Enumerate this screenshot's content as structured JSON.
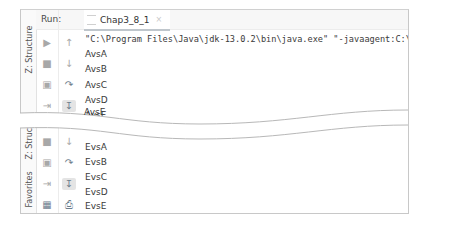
{
  "run_panel": {
    "run_label": "Run:",
    "tab": {
      "label": "Chap3_8_1",
      "close": "×"
    },
    "side_labels": {
      "structure": "Z: Structure",
      "favorites": "Favorites"
    }
  },
  "top_console": {
    "command_line": "\"C:\\Program Files\\Java\\jdk-13.0.2\\bin\\java.exe\" \"-javaagent:C:\\Progr",
    "lines": [
      "AvsA",
      "AvsB",
      "AvsC",
      "AvsD",
      "AvsE"
    ]
  },
  "bottom_console": {
    "lines": [
      "EvsA",
      "EvsB",
      "EvsC",
      "EvsD",
      "EvsE"
    ]
  },
  "icons": {
    "top_col1": [
      "rerun-icon",
      "stop-icon",
      "camera-icon",
      "exit-icon"
    ],
    "top_col2": [
      "up-arrow-icon",
      "down-arrow-icon",
      "soft-wrap-icon",
      "scroll-to-end-icon"
    ],
    "bottom_col1": [
      "stop-icon",
      "camera-icon",
      "exit-icon",
      "layout-icon"
    ],
    "bottom_col2": [
      "down-arrow-icon",
      "soft-wrap-icon",
      "scroll-to-end-icon",
      "print-icon"
    ]
  },
  "colors": {
    "border": "#c8c8c8",
    "text": "#3a3a3a",
    "icon": "#a8a8a8",
    "active_bg": "#e4e4e4"
  }
}
